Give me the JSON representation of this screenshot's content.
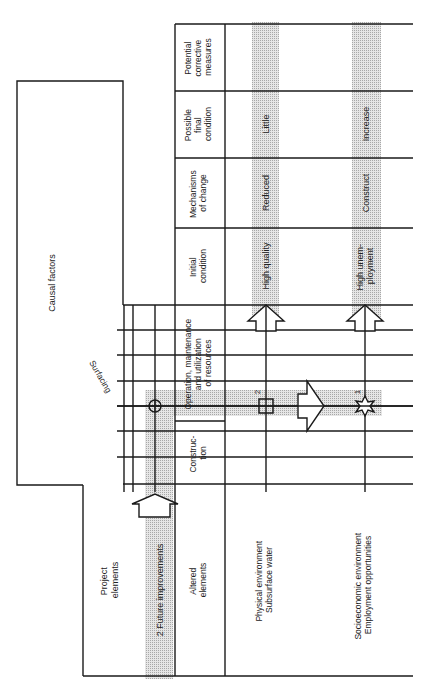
{
  "header_column": {
    "columns": [
      {
        "id": "corrective",
        "lines": [
          "Potential",
          "corrective",
          "measures"
        ]
      },
      {
        "id": "final",
        "lines": [
          "Possible",
          "final",
          "condition"
        ]
      },
      {
        "id": "mechanisms",
        "lines": [
          "Mechanisms",
          "of change"
        ]
      },
      {
        "id": "initial",
        "lines": [
          "Initial",
          "condition"
        ]
      },
      {
        "id": "operation",
        "lines": [
          "Operation, maintenance",
          "and utilization",
          "of resources"
        ]
      },
      {
        "id": "construction",
        "lines": [
          "Construc-",
          "tion"
        ]
      },
      {
        "id": "altered",
        "lines": [
          "Altered",
          "elements"
        ]
      }
    ]
  },
  "causal_factors": {
    "title": "Causal factors",
    "item": "Surfacing"
  },
  "project_elements": {
    "title_lines": [
      "Project",
      "elements"
    ],
    "item": "2 Future improvements"
  },
  "rows": [
    {
      "id": "physical",
      "element_lines": [
        "Physical environment",
        "Subsurface water"
      ],
      "marker_number": "2",
      "marker_shape": "square-cross",
      "initial_condition": "High quality",
      "mechanism": "Reduced",
      "final_condition": "Little",
      "corrective_measures": ""
    },
    {
      "id": "socioeconomic",
      "element_lines": [
        "Socioeconomic environment",
        "Employment opportunities"
      ],
      "marker_number": "1",
      "marker_shape": "star",
      "initial_condition_lines": [
        "High unem-",
        "ployment"
      ],
      "mechanism": "Construct",
      "final_condition": "Increase",
      "corrective_measures": ""
    }
  ],
  "colors": {
    "line": "#1a1a1a",
    "shade": "#d4d4d4",
    "background": "#ffffff"
  }
}
